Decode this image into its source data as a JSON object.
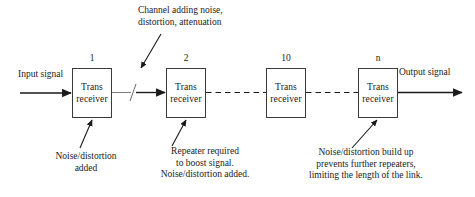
{
  "diagram": {
    "node_label_line1": "Trans",
    "node_label_line2": "receiver",
    "nodes": [
      {
        "id": "node-1",
        "number": "1",
        "line1": "Trans",
        "line2": "receiver",
        "x": 72,
        "y": 68
      },
      {
        "id": "node-2",
        "number": "2",
        "line1": "Trans",
        "line2": "receiver",
        "x": 166,
        "y": 68
      },
      {
        "id": "node-10",
        "number": "10",
        "line1": "Trans",
        "line2": "receiver",
        "x": 266,
        "y": 68
      },
      {
        "id": "node-n",
        "number": "n",
        "line1": "Trans",
        "line2": "receiver",
        "x": 358,
        "y": 68
      }
    ],
    "input_label": "Input signal",
    "output_label": "Output signal",
    "channel_note": {
      "line1": "Channel adding noise,",
      "line2": "distortion, attenuation"
    },
    "note_left": {
      "line1": "Noise/distortion",
      "line2": "added"
    },
    "note_middle": {
      "line1": "Repeater required",
      "line2": "to boost signal.",
      "line3": "Noise/distortion added."
    },
    "note_right": {
      "line1": "Noise/distortion build up",
      "line2": "prevents further repeaters,",
      "line3": "limiting the length of the link."
    },
    "colors": {
      "stroke": "#3a3a3a",
      "line": "#1a1a1a",
      "background": "#ffffff",
      "text": "#1a1a1a"
    }
  }
}
